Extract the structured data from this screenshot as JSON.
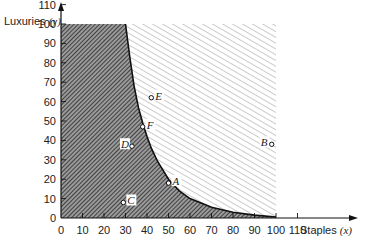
{
  "chart_data": {
    "type": "area",
    "title": "",
    "xlabel": "Staples",
    "xlabel_var": "(x)",
    "ylabel": "Luxuries",
    "ylabel_var": "(y)",
    "xlim": [
      0,
      115
    ],
    "ylim": [
      0,
      115
    ],
    "x_ticks": [
      0,
      10,
      20,
      30,
      40,
      50,
      60,
      70,
      80,
      90,
      100,
      110
    ],
    "y_ticks": [
      0,
      10,
      20,
      30,
      40,
      50,
      60,
      70,
      80,
      90,
      100,
      110
    ],
    "grid": false,
    "regions": [
      {
        "name": "dark-hatched",
        "description": "region below curve within 0-100 box",
        "fill": "#555555"
      },
      {
        "name": "light-hatched",
        "description": "region above curve within 0-100 box",
        "fill": "#d8d8d8"
      }
    ],
    "boundary_curve": {
      "x": [
        30,
        32,
        34,
        36,
        38,
        40,
        42,
        45,
        50,
        55,
        60,
        70,
        80,
        90,
        100
      ],
      "y": [
        100,
        83,
        68,
        57,
        49,
        42,
        36,
        29,
        20,
        14,
        10,
        5.5,
        3,
        1.5,
        0.5
      ]
    },
    "box": {
      "x": [
        0,
        100
      ],
      "y": [
        0,
        100
      ]
    },
    "points": [
      {
        "label": "A",
        "x": 50,
        "y": 18
      },
      {
        "label": "B",
        "x": 98,
        "y": 38
      },
      {
        "label": "C",
        "x": 29,
        "y": 8
      },
      {
        "label": "D",
        "x": 33,
        "y": 37
      },
      {
        "label": "E",
        "x": 42,
        "y": 62
      },
      {
        "label": "F",
        "x": 38,
        "y": 47
      }
    ]
  }
}
